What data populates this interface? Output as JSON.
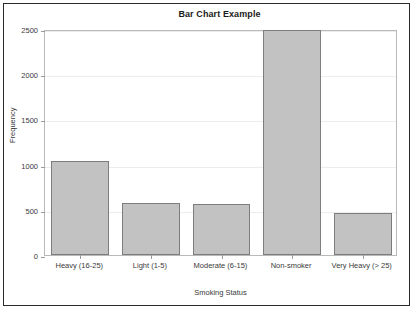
{
  "chart_data": {
    "type": "bar",
    "title": "Bar Chart Example",
    "xlabel": "Smoking Status",
    "ylabel": "Frequency",
    "categories": [
      "Heavy (16-25)",
      "Light (1-5)",
      "Moderate (6-15)",
      "Non-smoker",
      "Very Heavy (> 25)"
    ],
    "values": [
      1040,
      570,
      565,
      2490,
      470
    ],
    "ylim": [
      0,
      2500
    ],
    "yticks": [
      0,
      500,
      1000,
      1500,
      2000,
      2500
    ],
    "ytick_labels": [
      "0",
      "500",
      "1000",
      "1500",
      "2000",
      "2500"
    ],
    "grid": true,
    "legend": "none",
    "bar_fill_color": "#c2c2c2",
    "bar_border_color": "#7d7d7d",
    "gridline_color": "#ececec",
    "axis_color": "#b9b9b9",
    "frame_color": "#2b2b2b",
    "background_color": "#ffffff",
    "category_labels_wrapped": [
      "Heavy (16-25)",
      "Light (1-5)",
      "Moderate (6-15)",
      "Non-smoker",
      "Very Heavy (> 25)"
    ]
  }
}
